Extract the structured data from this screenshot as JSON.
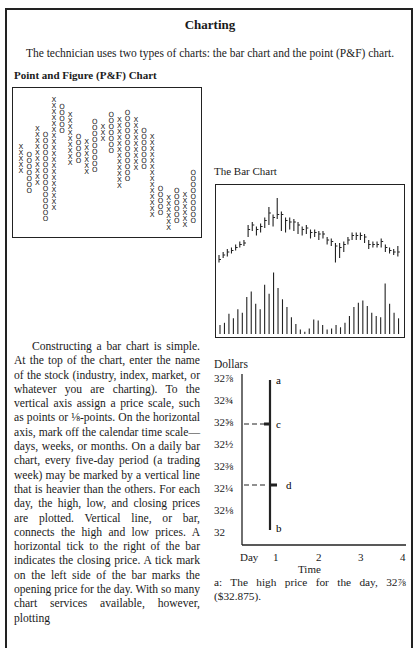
{
  "page": {
    "title": "Charting",
    "intro": "The technician uses two types of charts: the bar chart and the point (P&F) chart."
  },
  "pf_chart": {
    "heading": "Point and Figure (P&F) Chart",
    "columns": [
      {
        "type": "X",
        "top": 31,
        "bottom": 46
      },
      {
        "type": "O",
        "top": 35,
        "bottom": 58
      },
      {
        "type": "X",
        "top": 21,
        "bottom": 55
      },
      {
        "type": "O",
        "top": 24,
        "bottom": 73
      },
      {
        "type": "X",
        "top": 5,
        "bottom": 69
      },
      {
        "type": "O",
        "top": 9,
        "bottom": 26
      },
      {
        "type": "X",
        "top": 13,
        "bottom": 42
      },
      {
        "type": "O",
        "top": 25,
        "bottom": 42
      },
      {
        "type": "X",
        "top": 28,
        "bottom": 48
      },
      {
        "type": "O",
        "top": 17,
        "bottom": 47
      },
      {
        "type": "X",
        "top": 20,
        "bottom": 31
      },
      {
        "type": "O",
        "top": 13,
        "bottom": 35
      },
      {
        "type": "X",
        "top": 16,
        "bottom": 54
      },
      {
        "type": "O",
        "top": 12,
        "bottom": 50
      },
      {
        "type": "X",
        "top": 16,
        "bottom": 45
      },
      {
        "type": "O",
        "top": 22,
        "bottom": 44
      },
      {
        "type": "X",
        "top": 25,
        "bottom": 72
      },
      {
        "type": "O",
        "top": 54,
        "bottom": 69
      },
      {
        "type": "X",
        "top": 59,
        "bottom": 78
      },
      {
        "type": "O",
        "top": 55,
        "bottom": 75
      },
      {
        "type": "X",
        "top": 57,
        "bottom": 78
      },
      {
        "type": "O",
        "top": 45,
        "bottom": 75
      }
    ]
  },
  "bar_chart": {
    "heading": "The Bar Chart",
    "price_bars": [
      {
        "hi": 60,
        "lo": 65,
        "c": 63
      },
      {
        "hi": 58,
        "lo": 62,
        "c": 60
      },
      {
        "hi": 56,
        "lo": 61,
        "c": 58
      },
      {
        "hi": 55,
        "lo": 59,
        "c": 57
      },
      {
        "hi": 53,
        "lo": 57,
        "c": 55
      },
      {
        "hi": 51,
        "lo": 55,
        "c": 53
      },
      {
        "hi": 50,
        "lo": 54,
        "c": 52
      },
      {
        "hi": 40,
        "lo": 48,
        "c": 43
      },
      {
        "hi": 38,
        "lo": 44,
        "c": 40
      },
      {
        "hi": 41,
        "lo": 47,
        "c": 43
      },
      {
        "hi": 39,
        "lo": 45,
        "c": 41
      },
      {
        "hi": 35,
        "lo": 42,
        "c": 37
      },
      {
        "hi": 28,
        "lo": 40,
        "c": 32
      },
      {
        "hi": 33,
        "lo": 41,
        "c": 35
      },
      {
        "hi": 22,
        "lo": 36,
        "c": 33
      },
      {
        "hi": 31,
        "lo": 44,
        "c": 33
      },
      {
        "hi": 35,
        "lo": 45,
        "c": 37
      },
      {
        "hi": 35,
        "lo": 43,
        "c": 38
      },
      {
        "hi": 36,
        "lo": 44,
        "c": 38
      },
      {
        "hi": 38,
        "lo": 46,
        "c": 40
      },
      {
        "hi": 41,
        "lo": 47,
        "c": 43
      },
      {
        "hi": 40,
        "lo": 46,
        "c": 42
      },
      {
        "hi": 43,
        "lo": 49,
        "c": 45
      },
      {
        "hi": 43,
        "lo": 48,
        "c": 45
      },
      {
        "hi": 44,
        "lo": 50,
        "c": 46
      },
      {
        "hi": 44,
        "lo": 49,
        "c": 46
      },
      {
        "hi": 48,
        "lo": 53,
        "c": 50
      },
      {
        "hi": 49,
        "lo": 54,
        "c": 51
      },
      {
        "hi": 52,
        "lo": 65,
        "c": 54
      },
      {
        "hi": 52,
        "lo": 62,
        "c": 55
      },
      {
        "hi": 51,
        "lo": 58,
        "c": 53
      },
      {
        "hi": 48,
        "lo": 53,
        "c": 50
      },
      {
        "hi": 45,
        "lo": 50,
        "c": 47
      },
      {
        "hi": 45,
        "lo": 50,
        "c": 47
      },
      {
        "hi": 45,
        "lo": 50,
        "c": 47
      },
      {
        "hi": 46,
        "lo": 52,
        "c": 48
      },
      {
        "hi": 50,
        "lo": 56,
        "c": 53
      },
      {
        "hi": 51,
        "lo": 55,
        "c": 53
      },
      {
        "hi": 51,
        "lo": 55,
        "c": 53
      },
      {
        "hi": 49,
        "lo": 55,
        "c": 51
      },
      {
        "hi": 53,
        "lo": 58,
        "c": 55
      },
      {
        "hi": 55,
        "lo": 59,
        "c": 57
      },
      {
        "hi": 56,
        "lo": 60,
        "c": 58
      },
      {
        "hi": 54,
        "lo": 61,
        "c": 58
      }
    ],
    "volume": [
      8,
      10,
      18,
      14,
      22,
      19,
      33,
      38,
      27,
      22,
      44,
      36,
      55,
      41,
      31,
      24,
      15,
      9,
      4,
      2,
      5,
      13,
      12,
      8,
      4,
      5,
      8,
      6,
      10,
      16,
      24,
      28,
      30,
      25,
      19,
      16,
      15,
      45,
      27,
      19,
      14
    ]
  },
  "diagram": {
    "axis_label": "Dollars",
    "y_labels": [
      "32⅞",
      "32¾",
      "32⅝",
      "32½",
      "32⅜",
      "32¼",
      "32⅛",
      "32"
    ],
    "x_labels": [
      "Day",
      "1",
      "2",
      "3",
      "4"
    ],
    "x_title": "Time",
    "points": {
      "a": "a",
      "b": "b",
      "c": "c",
      "d": "d"
    }
  },
  "body": {
    "paragraph": "Constructing a bar chart is simple. At the top of the chart, enter the name of the stock (industry, index, market, or whatever you are charting). To the vertical axis assign a price scale, such as points or ⅛-points. On the horizontal axis, mark off the calendar time scale—days, weeks, or months. On a daily bar chart, every five-day period (a trading week) may be marked by a vertical line that is heavier than the others. For each day, the high, low, and closing prices are plotted. Vertical line, or bar, connects the high and low prices. A horizontal tick to the right of the bar indicates the closing price. A tick mark on the left side of the bar marks the opening price for the day. With so many chart services available, however, plotting"
  },
  "caption": {
    "a": "a: The high price for the day, 32⅞ ($32.875)."
  },
  "chart_data": [
    {
      "type": "scatter",
      "title": "Point and Figure (P&F) Chart",
      "xlabel": "",
      "ylabel": "",
      "note": "Alternating columns of X (rising) and O (falling); values are row positions from top of box",
      "series": [
        {
          "name": "columns",
          "values": "see pf_chart.columns"
        }
      ]
    },
    {
      "type": "bar",
      "title": "The Bar Chart",
      "xlabel": "",
      "ylabel": "",
      "note": "Upper panel: daily high-low-close bars; lower panel: volume bars (relative heights)",
      "series": [
        {
          "name": "volume",
          "values": "see bar_chart.volume"
        }
      ]
    },
    {
      "type": "line",
      "title": "",
      "xlabel": "Time",
      "ylabel": "Dollars",
      "categories": [
        "Day",
        "1",
        "2",
        "3",
        "4"
      ],
      "y_ticks": [
        32,
        32.125,
        32.25,
        32.375,
        32.5,
        32.625,
        32.75,
        32.875
      ],
      "series": [
        {
          "name": "a (high)",
          "x": 1,
          "y": 32.875
        },
        {
          "name": "b (low)",
          "x": 1,
          "y": 32.0
        },
        {
          "name": "c (open)",
          "x": 1,
          "y": 32.625
        },
        {
          "name": "d (close)",
          "x": 1,
          "y": 32.25
        }
      ]
    }
  ]
}
